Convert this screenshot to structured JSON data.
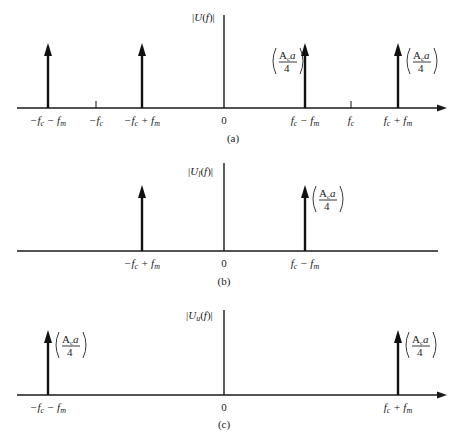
{
  "panels": [
    {
      "id": "a",
      "caption": "(a)",
      "y_label": "|U(f)|",
      "impulses": [
        {
          "pos": "−f_c − f_m",
          "label": "−fc − fm",
          "amplitude_label": ""
        },
        {
          "pos": "−f_c + f_m",
          "label": "−fc + fm",
          "amplitude_label": ""
        },
        {
          "pos": "f_c − f_m",
          "label": "fc − fm",
          "amplitude_label": "(Aca/4)"
        },
        {
          "pos": "f_c + f_m",
          "label": "fc + fm",
          "amplitude_label": "(Aca/4)"
        }
      ],
      "ticks": [
        {
          "label": "−fc"
        },
        {
          "label": "0"
        },
        {
          "label": "fc"
        }
      ]
    },
    {
      "id": "b",
      "caption": "(b)",
      "y_label": "|Ul(f)|",
      "impulses": [
        {
          "pos": "−f_c + f_m",
          "label": "−fc + fm",
          "amplitude_label": ""
        },
        {
          "pos": "f_c − f_m",
          "label": "fc − fm",
          "amplitude_label": "(Aca/4)"
        }
      ],
      "ticks": [
        {
          "label": "0"
        }
      ]
    },
    {
      "id": "c",
      "caption": "(c)",
      "y_label": "|Uu(f)|",
      "impulses": [
        {
          "pos": "−f_c − f_m",
          "label": "−fc − fm",
          "amplitude_label": "(Aca/4)"
        },
        {
          "pos": "f_c + f_m",
          "label": "fc + fm",
          "amplitude_label": "(Aca/4)"
        }
      ],
      "ticks": [
        {
          "label": "0"
        }
      ]
    }
  ],
  "labels": {
    "a_mfc_mfm": "−fc − fm",
    "a_mfc": "−fc",
    "a_mfc_pfm": "−fc + fm",
    "a_zero": "0",
    "a_fc_mfm": "fc − fm",
    "a_fc": "fc",
    "a_fc_pfm": "fc + fm",
    "b_mfc_pfm": "−fc + fm",
    "b_zero": "0",
    "b_fc_mfm": "fc − fm",
    "c_mfc_mfm": "−fc − fm",
    "c_zero": "0",
    "c_fc_pfm": "fc + fm",
    "amp_num": "Aca",
    "amp_den": "4",
    "cap_a": "(a)",
    "cap_b": "(b)",
    "cap_c": "(c)"
  }
}
